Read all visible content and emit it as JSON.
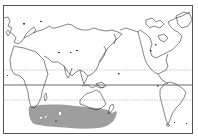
{
  "map": {
    "projection": "equirectangular, Pacific-centered (approx 20°E left edge)",
    "frame_color": "#555555",
    "coast_color": "#333333",
    "background": "#ffffff",
    "equator": {
      "label": "Equator",
      "style": "solid",
      "color": "#444444"
    },
    "tropics": [
      {
        "label": "Tropic of Cancer",
        "style": "dotted",
        "color": "#bbbbbb"
      },
      {
        "label": "Tropic of Capricorn",
        "style": "dotted",
        "color": "#bbbbbb"
      }
    ],
    "shaded_region": {
      "label": "Southern Indian Ocean distribution range",
      "fill": "#9e9e9e",
      "extent": "south of Africa to south of Australia/New Zealand, ~35°S–55°S"
    },
    "landmasses": [
      "Europe",
      "Africa",
      "Asia",
      "Australia",
      "New Zealand",
      "North America",
      "Greenland",
      "South America"
    ]
  }
}
